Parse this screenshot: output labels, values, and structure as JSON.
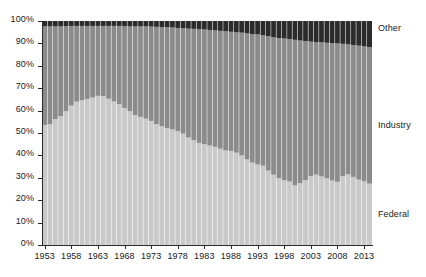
{
  "chart_data": {
    "type": "area",
    "title": "",
    "subtitle": "",
    "xlabel": "",
    "ylabel": "",
    "grid": false,
    "legend_position": "right-inline",
    "ylim": [
      0,
      100
    ],
    "ytick_labels": [
      "0%",
      "10%",
      "20%",
      "30%",
      "40%",
      "50%",
      "60%",
      "70%",
      "80%",
      "90%",
      "100%"
    ],
    "ytick_values": [
      0,
      10,
      20,
      30,
      40,
      50,
      60,
      70,
      80,
      90,
      100
    ],
    "xtick_labels": [
      "1953",
      "1958",
      "1963",
      "1968",
      "1973",
      "1978",
      "1983",
      "1988",
      "1993",
      "1998",
      "2003",
      "2008",
      "2013"
    ],
    "xtick_values": [
      1953,
      1958,
      1963,
      1968,
      1973,
      1978,
      1983,
      1988,
      1993,
      1998,
      2003,
      2008,
      2013
    ],
    "xlim": [
      1953,
      2015
    ],
    "x": [
      1953,
      1954,
      1955,
      1956,
      1957,
      1958,
      1959,
      1960,
      1961,
      1962,
      1963,
      1964,
      1965,
      1966,
      1967,
      1968,
      1969,
      1970,
      1971,
      1972,
      1973,
      1974,
      1975,
      1976,
      1977,
      1978,
      1979,
      1980,
      1981,
      1982,
      1983,
      1984,
      1985,
      1986,
      1987,
      1988,
      1989,
      1990,
      1991,
      1992,
      1993,
      1994,
      1995,
      1996,
      1997,
      1998,
      1999,
      2000,
      2001,
      2002,
      2003,
      2004,
      2005,
      2006,
      2007,
      2008,
      2009,
      2010,
      2011,
      2012,
      2013,
      2014
    ],
    "series": [
      {
        "name": "Federal",
        "color": "#c9c9c9",
        "values": [
          53.6,
          54.0,
          56.2,
          57.5,
          59.8,
          62.2,
          64.0,
          64.6,
          65.2,
          65.8,
          66.6,
          66.5,
          65.3,
          64.1,
          62.8,
          61.2,
          59.8,
          58.0,
          57.2,
          56.4,
          55.4,
          54.0,
          53.0,
          52.2,
          51.6,
          50.8,
          49.7,
          48.0,
          46.8,
          45.6,
          45.0,
          44.4,
          43.8,
          43.0,
          42.2,
          42.0,
          41.2,
          40.0,
          38.2,
          36.8,
          36.0,
          35.4,
          33.2,
          31.4,
          29.8,
          29.0,
          28.4,
          26.6,
          27.6,
          29.0,
          30.8,
          31.4,
          30.6,
          29.8,
          28.8,
          28.2,
          30.8,
          31.6,
          30.4,
          29.2,
          28.4,
          27.4
        ]
      },
      {
        "name": "Industry",
        "color": "#8b8b8b",
        "values": [
          44.0,
          43.6,
          41.4,
          40.1,
          37.9,
          35.6,
          33.8,
          33.2,
          32.6,
          32.0,
          31.2,
          31.3,
          32.5,
          33.7,
          35.0,
          36.5,
          37.8,
          39.6,
          40.4,
          41.2,
          42.1,
          43.4,
          44.3,
          45.0,
          45.5,
          46.1,
          47.1,
          48.6,
          49.7,
          50.7,
          51.2,
          51.6,
          52.0,
          52.6,
          53.2,
          53.2,
          53.8,
          54.8,
          56.3,
          57.4,
          58.0,
          58.2,
          60.0,
          61.3,
          62.6,
          63.2,
          63.5,
          65.0,
          63.7,
          62.0,
          60.0,
          59.2,
          59.9,
          60.5,
          61.3,
          61.8,
          59.0,
          58.0,
          58.9,
          59.8,
          60.3,
          61.0
        ]
      },
      {
        "name": "Other",
        "color": "#2b2b2b",
        "values": [
          2.4,
          2.4,
          2.4,
          2.4,
          2.3,
          2.2,
          2.2,
          2.2,
          2.2,
          2.2,
          2.2,
          2.2,
          2.2,
          2.2,
          2.2,
          2.3,
          2.4,
          2.4,
          2.4,
          2.4,
          2.5,
          2.6,
          2.7,
          2.8,
          2.9,
          3.1,
          3.2,
          3.4,
          3.5,
          3.7,
          3.8,
          4.0,
          4.2,
          4.4,
          4.6,
          4.8,
          5.0,
          5.2,
          5.5,
          5.8,
          6.0,
          6.4,
          6.8,
          7.3,
          7.6,
          7.8,
          8.1,
          8.4,
          8.7,
          9.0,
          9.2,
          9.4,
          9.5,
          9.7,
          9.9,
          10.0,
          10.2,
          10.4,
          10.7,
          11.0,
          11.3,
          11.6
        ]
      }
    ],
    "series_labels": [
      {
        "name": "Other",
        "text": "Other",
        "y_pct": 96.5
      },
      {
        "name": "Industry",
        "text": "Industry",
        "y_pct": 53.0
      },
      {
        "name": "Federal",
        "text": "Federal",
        "y_pct": 13.5
      }
    ]
  },
  "style": {
    "axis_color": "#2a2a2a",
    "text_color": "#1a1a1a",
    "background": "#ffffff",
    "bar_separator": "#ffffff"
  }
}
